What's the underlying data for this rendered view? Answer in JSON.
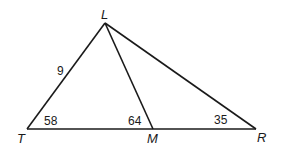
{
  "vertices": {
    "L": "L",
    "T": "T",
    "M": "M",
    "R": "R"
  },
  "segments": [
    "LT",
    "LM",
    "LR",
    "TM",
    "MR"
  ],
  "labels": {
    "side_LT": "9",
    "angle_T": "58",
    "angle_LMT": "64",
    "angle_R": "35"
  }
}
